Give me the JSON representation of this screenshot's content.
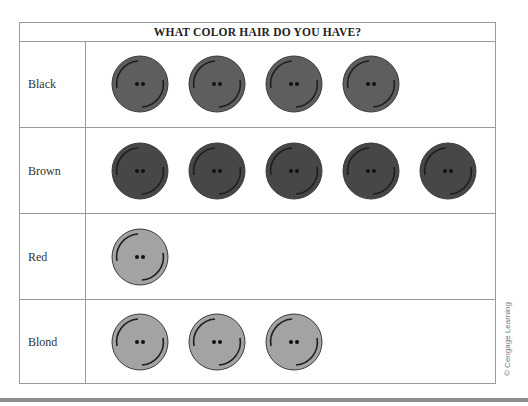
{
  "chart_data": {
    "type": "pictograph",
    "title": "WHAT COLOR HAIR DO YOU HAVE?",
    "categories": [
      "Black",
      "Brown",
      "Red",
      "Blond"
    ],
    "values": [
      4,
      5,
      1,
      3
    ],
    "icon": "button",
    "icon_colors": {
      "Black": "#5e5e5e",
      "Brown": "#474747",
      "Red": "#a3a3a3",
      "Blond": "#a3a3a3"
    },
    "xlabel": "",
    "ylabel": "",
    "legend": null,
    "grid": "table"
  },
  "chart": {
    "title": "WHAT COLOR HAIR DO YOU HAVE?",
    "rows": [
      {
        "label": "Black",
        "count": 4,
        "color": "#5e5e5e"
      },
      {
        "label": "Brown",
        "count": 5,
        "color": "#474747"
      },
      {
        "label": "Red",
        "count": 1,
        "color": "#a3a3a3"
      },
      {
        "label": "Blond",
        "count": 3,
        "color": "#a3a3a3"
      }
    ]
  },
  "credit": "© Cengage Learning"
}
